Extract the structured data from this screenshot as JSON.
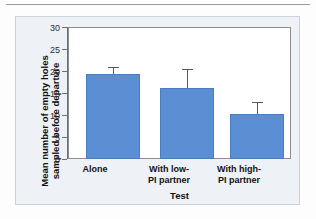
{
  "figure": {
    "panel_background": "#eef2f7",
    "panel_border": "#c9d2dc"
  },
  "chart_data": {
    "type": "bar",
    "title": "",
    "xlabel": "Test",
    "ylabel": "Mean number of empty holes sampled before departure",
    "ylabel_line1": "Mean number of empty holes",
    "ylabel_line2": "sampled before departure",
    "categories": [
      "Alone",
      "With low-PI partner",
      "With high-PI partner"
    ],
    "category_lines": [
      [
        "Alone",
        ""
      ],
      [
        "With low-",
        "PI partner"
      ],
      [
        "With high-",
        "PI partner"
      ]
    ],
    "values": [
      19.3,
      16.2,
      10.2
    ],
    "errors": [
      1.3,
      4.1,
      2.5
    ],
    "error_type": "standard error",
    "ylim": [
      0,
      30
    ],
    "yticks": [
      0,
      5,
      10,
      15,
      20,
      25,
      30
    ],
    "ytick_labels": [
      "0",
      "5",
      "10",
      "15",
      "20",
      "25",
      "30"
    ],
    "grid": false,
    "legend": "none",
    "bar_color": "#5b8fd4",
    "bar_edge_color": "#4a7cc0",
    "error_bar_color": "#5a5a5a"
  }
}
